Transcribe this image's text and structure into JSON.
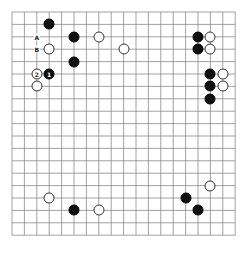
{
  "board": {
    "size": 19,
    "origin_x": 12,
    "origin_y": 12,
    "spacing": 12.4,
    "line_color": "#8a8a8a",
    "stones": [
      {
        "color": "black",
        "col": 3,
        "row": 1,
        "label": ""
      },
      {
        "color": "black",
        "col": 5,
        "row": 2,
        "label": ""
      },
      {
        "color": "white",
        "col": 7,
        "row": 2,
        "label": ""
      },
      {
        "color": "white",
        "col": 3,
        "row": 3,
        "label": ""
      },
      {
        "color": "white",
        "col": 9,
        "row": 3,
        "label": ""
      },
      {
        "color": "black",
        "col": 5,
        "row": 4,
        "label": ""
      },
      {
        "color": "white",
        "col": 2,
        "row": 5,
        "label": "2"
      },
      {
        "color": "black",
        "col": 3,
        "row": 5,
        "label": "1"
      },
      {
        "color": "white",
        "col": 2,
        "row": 6,
        "label": ""
      },
      {
        "color": "black",
        "col": 15,
        "row": 2,
        "label": ""
      },
      {
        "color": "white",
        "col": 16,
        "row": 2,
        "label": ""
      },
      {
        "color": "black",
        "col": 15,
        "row": 3,
        "label": ""
      },
      {
        "color": "white",
        "col": 16,
        "row": 3,
        "label": ""
      },
      {
        "color": "black",
        "col": 16,
        "row": 5,
        "label": ""
      },
      {
        "color": "white",
        "col": 17,
        "row": 5,
        "label": ""
      },
      {
        "color": "black",
        "col": 16,
        "row": 6,
        "label": ""
      },
      {
        "color": "white",
        "col": 17,
        "row": 6,
        "label": ""
      },
      {
        "color": "black",
        "col": 16,
        "row": 7,
        "label": ""
      },
      {
        "color": "white",
        "col": 3,
        "row": 15,
        "label": ""
      },
      {
        "color": "black",
        "col": 5,
        "row": 16,
        "label": ""
      },
      {
        "color": "white",
        "col": 7,
        "row": 16,
        "label": ""
      },
      {
        "color": "white",
        "col": 16,
        "row": 14,
        "label": ""
      },
      {
        "color": "black",
        "col": 14,
        "row": 15,
        "label": ""
      },
      {
        "color": "black",
        "col": 15,
        "row": 16,
        "label": ""
      }
    ],
    "markers": [
      {
        "text": "A",
        "col": 2,
        "row": 2
      },
      {
        "text": "B",
        "col": 2,
        "row": 3
      }
    ]
  }
}
